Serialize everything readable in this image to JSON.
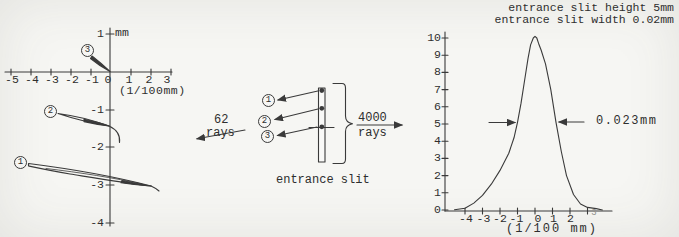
{
  "figure": {
    "left_chart": {
      "y_unit_label": "mm",
      "x_axis_label": "(1/100mm)",
      "x_ticks": [
        "-5",
        "-4",
        "-3",
        "-2",
        "-1",
        "0",
        "1",
        "2",
        "3"
      ],
      "y_ticks": [
        "1",
        "-1",
        "-2",
        "-3",
        "-4"
      ],
      "spot_labels": [
        "1",
        "2",
        "3"
      ]
    },
    "middle": {
      "rays_in_count": "62",
      "rays_in_word": "rays",
      "rays_out_count": "4000",
      "rays_out_word": "rays",
      "slit_caption": "entrance slit",
      "ray_labels": [
        "1",
        "2",
        "3"
      ]
    },
    "right_chart": {
      "title_line1": "entrance slit height 5mm",
      "title_line2": "entrance slit width 0.02mm",
      "width_annotation": "0.023mm",
      "x_axis_label": "(1/100 mm)",
      "x_ticks": [
        "-4",
        "-3",
        "-2",
        "-1",
        "0",
        "1",
        "2",
        "3"
      ],
      "y_ticks": [
        "10",
        "9",
        "8",
        "7",
        "6",
        "5",
        "4",
        "3",
        "2",
        "1",
        "0"
      ]
    }
  },
  "chart_data": [
    {
      "type": "scatter",
      "title": "",
      "xlabel": "(1/100mm)",
      "ylabel": "mm",
      "xlim": [
        -5,
        3
      ],
      "ylim": [
        -4,
        1
      ],
      "grid": false,
      "series": [
        {
          "name": "1",
          "points": [
            [
              -4.05,
              -2.42
            ],
            [
              -2.0,
              -2.6
            ],
            [
              0,
              -2.8
            ],
            [
              1.0,
              -2.93
            ],
            [
              2.05,
              -3.05
            ],
            [
              2.4,
              -3.12
            ]
          ]
        },
        {
          "name": "2",
          "points": [
            [
              -2.55,
              -1.11
            ],
            [
              -1.3,
              -1.26
            ],
            [
              0,
              -1.43
            ],
            [
              0.35,
              -1.6
            ],
            [
              0.55,
              -1.85
            ]
          ]
        },
        {
          "name": "3",
          "points": [
            [
              -0.85,
              0.42
            ],
            [
              -0.4,
              0.2
            ],
            [
              0,
              0
            ]
          ]
        }
      ]
    },
    {
      "type": "line",
      "title": "entrance slit height 5mm / entrance slit width 0.02mm",
      "xlabel": "(1/100 mm)",
      "ylabel": "",
      "xlim": [
        -5,
        3.9
      ],
      "ylim": [
        0,
        10
      ],
      "grid": false,
      "annotations": [
        "0.023mm"
      ],
      "x": [
        -4.6,
        -4.0,
        -3.5,
        -3.0,
        -2.5,
        -2.0,
        -1.5,
        -1.2,
        -1.0,
        -0.8,
        -0.6,
        -0.4,
        -0.25,
        -0.1,
        0.0,
        0.1,
        0.2,
        0.35,
        0.6,
        0.9,
        1.2,
        1.5,
        1.8,
        2.2,
        2.6,
        3.0,
        3.5,
        3.85
      ],
      "y": [
        0.02,
        0.1,
        0.4,
        0.85,
        1.5,
        2.3,
        3.3,
        4.2,
        5.1,
        6.2,
        7.5,
        8.8,
        9.6,
        10.0,
        10.1,
        10.0,
        9.7,
        9.3,
        8.5,
        7.0,
        5.1,
        3.4,
        2.0,
        0.9,
        0.35,
        0.15,
        0.08,
        0.0
      ]
    }
  ]
}
